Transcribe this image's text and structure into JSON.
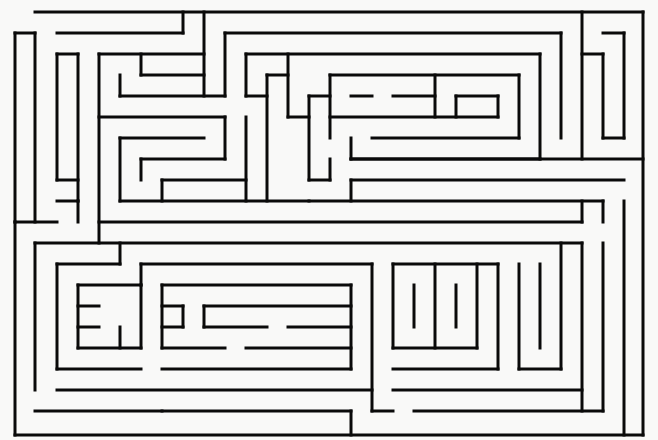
{
  "title": "Maze",
  "colors": {
    "background": "#f9f9f8",
    "wall": "#0a0a0a"
  },
  "maze": {
    "width": 658,
    "height": 440,
    "stroke_width": 3,
    "walls": [
      [
        35,
        12,
        643,
        12
      ],
      [
        643,
        12,
        643,
        435
      ],
      [
        15,
        435,
        643,
        435
      ],
      [
        15,
        33,
        15,
        222
      ],
      [
        15,
        222,
        57,
        222
      ],
      [
        15,
        222,
        15,
        435
      ],
      [
        15,
        33,
        35,
        33
      ],
      [
        35,
        33,
        35,
        222
      ],
      [
        57,
        33,
        183,
        33
      ],
      [
        183,
        12,
        183,
        33
      ],
      [
        57,
        54,
        57,
        180
      ],
      [
        57,
        54,
        78,
        54
      ],
      [
        78,
        54,
        78,
        201
      ],
      [
        99,
        54,
        204,
        54
      ],
      [
        204,
        12,
        204,
        96
      ],
      [
        141,
        54,
        141,
        75
      ],
      [
        141,
        75,
        204,
        75
      ],
      [
        120,
        75,
        120,
        96
      ],
      [
        120,
        96,
        225,
        96
      ],
      [
        225,
        33,
        225,
        96
      ],
      [
        99,
        54,
        99,
        243
      ],
      [
        99,
        117,
        225,
        117
      ],
      [
        225,
        117,
        225,
        159
      ],
      [
        120,
        138,
        120,
        201
      ],
      [
        120,
        138,
        204,
        138
      ],
      [
        141,
        159,
        141,
        180
      ],
      [
        141,
        159,
        225,
        159
      ],
      [
        162,
        180,
        162,
        201
      ],
      [
        162,
        180,
        246,
        180
      ],
      [
        246,
        117,
        246,
        201
      ],
      [
        120,
        201,
        309,
        201
      ],
      [
        57,
        180,
        78,
        180
      ],
      [
        57,
        201,
        78,
        201
      ],
      [
        78,
        201,
        78,
        222
      ],
      [
        225,
        33,
        561,
        33
      ],
      [
        561,
        33,
        561,
        138
      ],
      [
        246,
        54,
        540,
        54
      ],
      [
        540,
        54,
        540,
        159
      ],
      [
        246,
        54,
        246,
        96
      ],
      [
        246,
        96,
        267,
        96
      ],
      [
        267,
        75,
        267,
        201
      ],
      [
        267,
        75,
        288,
        75
      ],
      [
        288,
        54,
        288,
        117
      ],
      [
        288,
        117,
        309,
        117
      ],
      [
        309,
        96,
        309,
        180
      ],
      [
        309,
        96,
        330,
        96
      ],
      [
        330,
        75,
        330,
        138
      ],
      [
        330,
        75,
        519,
        75
      ],
      [
        519,
        75,
        519,
        138
      ],
      [
        351,
        96,
        372,
        96
      ],
      [
        393,
        96,
        435,
        96
      ],
      [
        435,
        75,
        435,
        117
      ],
      [
        456,
        96,
        498,
        96
      ],
      [
        498,
        96,
        498,
        117
      ],
      [
        456,
        96,
        456,
        117
      ],
      [
        330,
        117,
        498,
        117
      ],
      [
        372,
        138,
        519,
        138
      ],
      [
        351,
        138,
        351,
        159
      ],
      [
        351,
        159,
        540,
        159
      ],
      [
        309,
        180,
        330,
        180
      ],
      [
        330,
        159,
        330,
        180
      ],
      [
        351,
        180,
        351,
        201
      ],
      [
        351,
        180,
        624,
        180
      ],
      [
        582,
        12,
        582,
        159
      ],
      [
        582,
        54,
        603,
        54
      ],
      [
        603,
        54,
        603,
        138
      ],
      [
        603,
        138,
        624,
        138
      ],
      [
        624,
        33,
        624,
        138
      ],
      [
        603,
        33,
        624,
        33
      ],
      [
        351,
        159,
        643,
        159
      ],
      [
        309,
        201,
        603,
        201
      ],
      [
        99,
        222,
        582,
        222
      ],
      [
        582,
        201,
        582,
        222
      ],
      [
        35,
        243,
        582,
        243
      ],
      [
        35,
        243,
        35,
        390
      ],
      [
        120,
        243,
        120,
        264
      ],
      [
        57,
        264,
        120,
        264
      ],
      [
        57,
        264,
        57,
        369
      ],
      [
        141,
        264,
        372,
        264
      ],
      [
        141,
        264,
        141,
        285
      ],
      [
        162,
        285,
        162,
        348
      ],
      [
        78,
        285,
        141,
        285
      ],
      [
        78,
        285,
        78,
        348
      ],
      [
        78,
        306,
        99,
        306
      ],
      [
        78,
        327,
        99,
        327
      ],
      [
        78,
        348,
        141,
        348
      ],
      [
        141,
        285,
        141,
        348
      ],
      [
        120,
        327,
        120,
        348
      ],
      [
        162,
        285,
        351,
        285
      ],
      [
        351,
        285,
        351,
        369
      ],
      [
        162,
        306,
        183,
        306
      ],
      [
        183,
        306,
        183,
        327
      ],
      [
        162,
        327,
        183,
        327
      ],
      [
        204,
        306,
        351,
        306
      ],
      [
        204,
        306,
        204,
        327
      ],
      [
        204,
        327,
        267,
        327
      ],
      [
        288,
        327,
        351,
        327
      ],
      [
        162,
        348,
        225,
        348
      ],
      [
        246,
        348,
        351,
        348
      ],
      [
        162,
        369,
        351,
        369
      ],
      [
        372,
        264,
        372,
        411
      ],
      [
        57,
        369,
        141,
        369
      ],
      [
        57,
        390,
        372,
        390
      ],
      [
        162,
        411,
        351,
        411
      ],
      [
        351,
        411,
        351,
        435
      ],
      [
        35,
        411,
        162,
        411
      ],
      [
        393,
        264,
        498,
        264
      ],
      [
        393,
        264,
        393,
        348
      ],
      [
        414,
        285,
        414,
        327
      ],
      [
        435,
        264,
        435,
        348
      ],
      [
        456,
        285,
        456,
        327
      ],
      [
        477,
        264,
        477,
        348
      ],
      [
        393,
        348,
        477,
        348
      ],
      [
        498,
        264,
        498,
        369
      ],
      [
        393,
        369,
        498,
        369
      ],
      [
        519,
        264,
        519,
        369
      ],
      [
        519,
        369,
        561,
        369
      ],
      [
        540,
        264,
        540,
        348
      ],
      [
        561,
        243,
        561,
        369
      ],
      [
        582,
        243,
        582,
        411
      ],
      [
        393,
        390,
        582,
        390
      ],
      [
        603,
        201,
        603,
        222
      ],
      [
        603,
        243,
        603,
        411
      ],
      [
        414,
        411,
        603,
        411
      ],
      [
        624,
        201,
        624,
        435
      ],
      [
        372,
        411,
        393,
        411
      ]
    ]
  }
}
